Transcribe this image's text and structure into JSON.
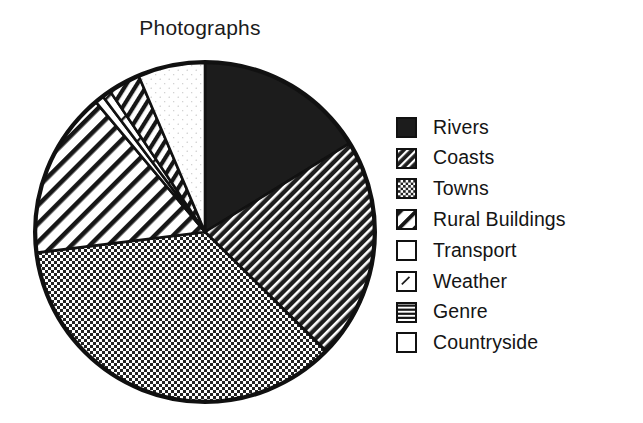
{
  "chart_data": {
    "type": "pie",
    "title": "Photographs",
    "xlabel": "",
    "ylabel": "",
    "legend_position": "right",
    "grid": false,
    "start_angle_deg": 0,
    "direction": "clockwise",
    "categories": [
      "Rivers",
      "Coasts",
      "Towns",
      "Rural Buildings",
      "Transport",
      "Weather",
      "Genre",
      "Countryside"
    ],
    "values": [
      16.3,
      21.1,
      35.7,
      15.8,
      0.8,
      0.8,
      3.1,
      6.4
    ],
    "slices": [
      {
        "label": "Rivers",
        "value": 16.3,
        "start_deg": 0.0,
        "end_deg": 58.5,
        "fill": "solid-black",
        "swatch": "solid-black-swatch"
      },
      {
        "label": "Coasts",
        "value": 21.1,
        "start_deg": 58.5,
        "end_deg": 134.5,
        "fill": "fine-diagonal-dark",
        "swatch": "fine-diagonal-dark-swatch"
      },
      {
        "label": "Towns",
        "value": 35.7,
        "start_deg": 134.5,
        "end_deg": 263.0,
        "fill": "checker-dot-dark",
        "swatch": "checker-dot-dark-swatch"
      },
      {
        "label": "Rural Buildings",
        "value": 15.8,
        "start_deg": 263.0,
        "end_deg": 320.0,
        "fill": "bold-diagonal",
        "swatch": "bold-diagonal-swatch"
      },
      {
        "label": "Transport",
        "value": 0.8,
        "start_deg": 320.0,
        "end_deg": 323.0,
        "fill": "white-plain",
        "swatch": "white-plain-swatch"
      },
      {
        "label": "Weather",
        "value": 0.8,
        "start_deg": 323.0,
        "end_deg": 326.0,
        "fill": "white-tick",
        "swatch": "white-tick-swatch"
      },
      {
        "label": "Genre",
        "value": 3.1,
        "start_deg": 326.0,
        "end_deg": 337.0,
        "fill": "horizontal-stripe",
        "swatch": "horizontal-stripe-swatch"
      },
      {
        "label": "Countryside",
        "value": 6.4,
        "start_deg": 337.0,
        "end_deg": 360.0,
        "fill": "white-stipple",
        "swatch": "white-plain-swatch"
      }
    ]
  },
  "colors": {
    "ink": "#111111",
    "paper": "#ffffff",
    "dark_fill": "#1c1c1c",
    "mid_fill": "#3a3a3a"
  },
  "legend": {
    "items": [
      {
        "label": "Rivers"
      },
      {
        "label": "Coasts"
      },
      {
        "label": "Towns"
      },
      {
        "label": "Rural Buildings"
      },
      {
        "label": "Transport"
      },
      {
        "label": "Weather"
      },
      {
        "label": "Genre"
      },
      {
        "label": "Countryside"
      }
    ]
  }
}
